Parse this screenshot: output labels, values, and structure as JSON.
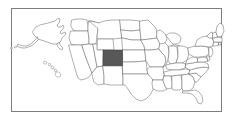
{
  "figure": {
    "type": "choropleth-locator-map",
    "width": 234,
    "height": 120,
    "background_color": "#ffffff",
    "frame": {
      "visible": true,
      "color": "#7d7d7d",
      "x": 11,
      "y": 8,
      "width": 211,
      "height": 104
    }
  },
  "map": {
    "region": "United States of America",
    "projection_style": "composite (contiguous + Alaska inset + Hawaii inset)",
    "outline_color": "#6e6e6e",
    "fill_color": "#ffffff",
    "highlight_color": "#585858",
    "labels_visible": false,
    "legend_visible": false,
    "highlighted_states": [
      "Colorado"
    ],
    "highlight_bbox": {
      "x": 103,
      "y": 50,
      "width": 20,
      "height": 16
    },
    "insets": [
      {
        "name": "Alaska",
        "position": "upper-left",
        "highlighted": false
      },
      {
        "name": "Hawaii",
        "position": "lower-left",
        "highlighted": false
      }
    ],
    "states": [
      "Washington",
      "Oregon",
      "California",
      "Nevada",
      "Idaho",
      "Montana",
      "Wyoming",
      "Utah",
      "Arizona",
      "Colorado",
      "New Mexico",
      "North Dakota",
      "South Dakota",
      "Nebraska",
      "Kansas",
      "Oklahoma",
      "Texas",
      "Minnesota",
      "Iowa",
      "Missouri",
      "Arkansas",
      "Louisiana",
      "Wisconsin",
      "Illinois",
      "Michigan",
      "Indiana",
      "Ohio",
      "Kentucky",
      "Tennessee",
      "Mississippi",
      "Alabama",
      "Georgia",
      "Florida",
      "South Carolina",
      "North Carolina",
      "Virginia",
      "West Virginia",
      "Maryland",
      "Delaware",
      "Pennsylvania",
      "New Jersey",
      "New York",
      "Connecticut",
      "Rhode Island",
      "Massachusetts",
      "Vermont",
      "New Hampshire",
      "Maine",
      "Alaska",
      "Hawaii"
    ]
  },
  "chart_data": {
    "type": "map",
    "categories": [
      "Colorado",
      "other states"
    ],
    "values": [
      1,
      0
    ],
    "legend": [],
    "xlabel": "",
    "ylabel": ""
  }
}
